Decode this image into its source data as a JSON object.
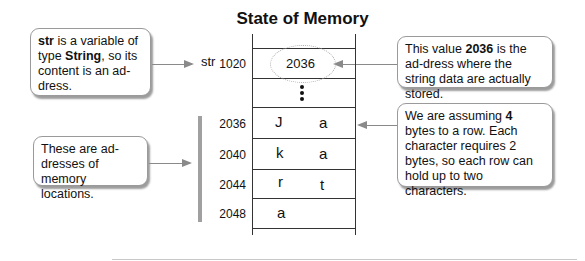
{
  "title": "State of Memory",
  "callouts": {
    "str_variable": {
      "bold1": "str",
      "text1": " is a variable of type ",
      "bold2": "String",
      "text2": ", so its content is an ad-dress."
    },
    "addresses": {
      "text": "These are ad-dresses of memory locations."
    },
    "value_2036": {
      "text1": "This value ",
      "bold1": "2036",
      "text2": " is the ad-dress where the string data are actually stored."
    },
    "bytes_per_row": {
      "text1": "We are assuming ",
      "bold1": "4",
      "text2": " bytes to a row. Each character requires 2 bytes, so each row can hold up to two characters."
    }
  },
  "memory": {
    "variable_label": "str",
    "pointer_row": {
      "address": "1020",
      "value": "2036"
    },
    "rows": [
      {
        "address": "2036",
        "char1": "J",
        "char2": "a"
      },
      {
        "address": "2040",
        "char1": "k",
        "char2": "a"
      },
      {
        "address": "2044",
        "char1": "r",
        "char2": "t"
      },
      {
        "address": "2048",
        "char1": "a",
        "char2": ""
      }
    ]
  }
}
